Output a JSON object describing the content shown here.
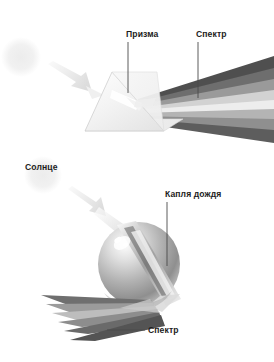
{
  "figure": {
    "background_color": "#ffffff",
    "width": 274,
    "height": 362
  },
  "labels": {
    "prism": "Призма",
    "spectrum_top": "Спектр",
    "sun": "Солнце",
    "raindrop": "Капля дождя",
    "spectrum_bottom": "Спектр"
  },
  "icon_names": {
    "sun_top": "sun-icon",
    "sun_bottom": "sun-icon",
    "arrow_top": "light-ray-arrow-icon",
    "arrow_bottom": "light-ray-arrow-icon",
    "prism": "prism-icon",
    "raindrop": "raindrop-sphere-icon"
  },
  "colors": {
    "text": "#1c1c1c",
    "leader_line": "#4a4a4a",
    "sun_glow": "#f2f2f2",
    "arrow_fill": "#ebebeb",
    "prism_face": "#f4f4f4",
    "prism_edge": "#c9c9c9",
    "band_darkest": "#4f4f4f",
    "band_dark": "#6e6e6e",
    "band_mid": "#8f8f8f",
    "band_light": "#b4b4b4",
    "band_lighter": "#d2d2d2",
    "band_lightest": "#ededed"
  },
  "scenes": [
    {
      "name": "prism-scene",
      "elements": [
        "sun-icon",
        "light-ray-arrow-icon",
        "prism-icon",
        "spectrum-fan"
      ],
      "spectrum_bands": [
        {
          "index": 0,
          "color": "#4f4f4f"
        },
        {
          "index": 1,
          "color": "#6e6e6e"
        },
        {
          "index": 2,
          "color": "#8f8f8f"
        },
        {
          "index": 3,
          "color": "#b4b4b4"
        },
        {
          "index": 4,
          "color": "#d2d2d2"
        },
        {
          "index": 5,
          "color": "#ededed"
        },
        {
          "index": 6,
          "color": "#9a9a9a"
        },
        {
          "index": 7,
          "color": "#6b6b6b"
        }
      ]
    },
    {
      "name": "raindrop-scene",
      "elements": [
        "sun-icon",
        "light-ray-arrow-icon",
        "raindrop-sphere-icon",
        "spectrum-fan"
      ],
      "spectrum_bands": [
        {
          "index": 0,
          "color": "#6f6f6f"
        },
        {
          "index": 1,
          "color": "#8d8d8d"
        },
        {
          "index": 2,
          "color": "#ababab"
        },
        {
          "index": 3,
          "color": "#c6c6c6"
        },
        {
          "index": 4,
          "color": "#9c9c9c"
        },
        {
          "index": 5,
          "color": "#707070"
        },
        {
          "index": 6,
          "color": "#5a5a5a"
        }
      ]
    }
  ]
}
